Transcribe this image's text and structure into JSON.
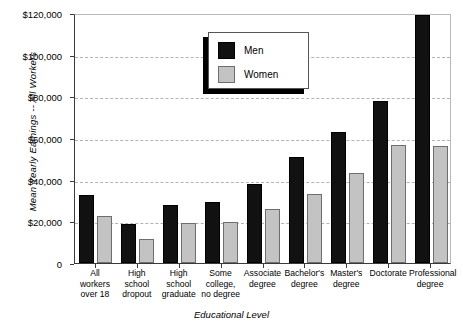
{
  "chart_data": {
    "type": "bar",
    "title": "",
    "xlabel": "Educational Level",
    "ylabel": "Mean Yearly Earnings -- All Workers",
    "ylim": [
      0,
      120000
    ],
    "ytick_labels": [
      "$120,000",
      "$100,000",
      "$80,000",
      "$60,000",
      "$40,000",
      "$20,000",
      "0"
    ],
    "ytick_values": [
      120000,
      100000,
      80000,
      60000,
      40000,
      20000,
      0
    ],
    "grid": true,
    "grid_axis": "y",
    "legend_position": "upper-left-inside",
    "categories": [
      "All workers over 18",
      "High school dropout",
      "High school graduate",
      "Some college, no degree",
      "Associate degree",
      "Bachelor's degree",
      "Master's degree",
      "Doctorate",
      "Professional degree"
    ],
    "category_lines": [
      [
        "All",
        "workers",
        "over 18"
      ],
      [
        "High",
        "school",
        "dropout"
      ],
      [
        "High",
        "school",
        "graduate"
      ],
      [
        "Some",
        "college,",
        "no degree"
      ],
      [
        "Associate",
        "degree"
      ],
      [
        "Bachelor's",
        "degree"
      ],
      [
        "Master's",
        "degree"
      ],
      [
        "Doctorate"
      ],
      [
        "Professional",
        "degree"
      ]
    ],
    "series": [
      {
        "name": "Men",
        "color": "#111111",
        "values": [
          32500,
          18500,
          28000,
          29500,
          38000,
          51000,
          63000,
          78000,
          119000
        ]
      },
      {
        "name": "Women",
        "color": "#c3c3c3",
        "values": [
          22500,
          11500,
          19000,
          19500,
          26000,
          33000,
          43000,
          56500,
          56000
        ]
      }
    ]
  },
  "legend": {
    "entries": [
      {
        "label": "Men"
      },
      {
        "label": "Women"
      }
    ]
  }
}
